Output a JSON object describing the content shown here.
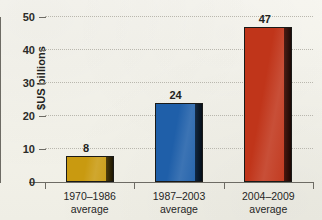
{
  "chart_data": {
    "type": "bar",
    "title": "",
    "xlabel": "",
    "ylabel": "$US billions",
    "categories": [
      "1970–1986\naverage",
      "1987–2003\naverage",
      "2004–2009\naverage"
    ],
    "category_lines": [
      {
        "line1": "1970–1986",
        "line2": "average"
      },
      {
        "line1": "1987–2003",
        "line2": "average"
      },
      {
        "line1": "2004–2009",
        "line2": "average"
      }
    ],
    "values": [
      8,
      24,
      47
    ],
    "value_labels": [
      "8",
      "24",
      "47"
    ],
    "bar_colors": [
      "#c99a10",
      "#1f5fa9",
      "#c0351a"
    ],
    "ylim": [
      0,
      50
    ],
    "yticks": [
      0,
      10,
      20,
      30,
      40,
      50
    ],
    "ytick_labels": [
      "0",
      "10",
      "20",
      "30",
      "40",
      "50"
    ],
    "grid": true,
    "legend": false,
    "legend_position": "none"
  },
  "axes": {
    "y_label": "$US billions",
    "y_tick_labels": [
      "50",
      "40",
      "30",
      "20",
      "10",
      "0"
    ]
  },
  "colors": {
    "background": "#f6f5ef",
    "axis": "#6d6b64",
    "grid": "#b9b7ae",
    "text": "#232320",
    "bar_gold": "#c99a10",
    "bar_blue": "#1f5fa9",
    "bar_red": "#c0351a",
    "bar_shadow": "#1a1a18"
  }
}
